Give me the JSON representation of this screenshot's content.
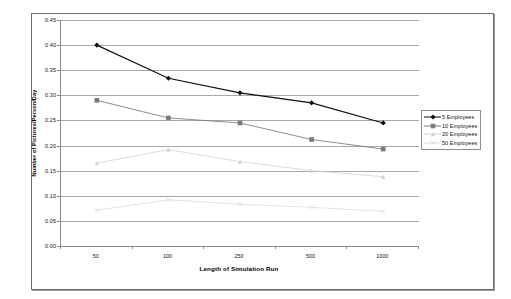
{
  "chart_data": {
    "type": "line",
    "title": "",
    "xlabel": "Length of Simulation Run",
    "ylabel": "Number of Pictures/Person/Day",
    "categories": [
      "50",
      "100",
      "250",
      "500",
      "1000"
    ],
    "ylim": [
      0.0,
      0.45
    ],
    "ytick_step": 0.05,
    "ytick_labels": [
      "0.00",
      "0.05",
      "0.10",
      "0.15",
      "0.20",
      "0.25",
      "0.30",
      "0.35",
      "0.40",
      "0.45"
    ],
    "ytick_values": [
      0.0,
      0.05,
      0.1,
      0.15,
      0.2,
      0.25,
      0.3,
      0.35,
      0.4,
      0.45
    ],
    "grid": "horizontal",
    "legend_position": "right",
    "series": [
      {
        "name": "5 Employees",
        "values": [
          0.4,
          0.334,
          0.305,
          0.285,
          0.245
        ],
        "color": "#101010",
        "marker": "diamond",
        "marker_size": 2.6,
        "line_width": 1.15
      },
      {
        "name": "10 Employees",
        "values": [
          0.29,
          0.255,
          0.245,
          0.212,
          0.193
        ],
        "color": "#7a7a7a",
        "marker": "square",
        "marker_size": 2.3,
        "line_width": 0.85
      },
      {
        "name": "20 Employees",
        "values": [
          0.165,
          0.192,
          0.168,
          0.15,
          0.138
        ],
        "color": "#d2d2d2",
        "marker": "triangle",
        "marker_size": 2.2,
        "line_width": 0.8
      },
      {
        "name": "50 Employees",
        "values": [
          0.071,
          0.092,
          0.083,
          0.077,
          0.069
        ],
        "color": "#dcdcdc",
        "marker": "cross",
        "marker_size": 2.2,
        "line_width": 0.8
      }
    ]
  },
  "legend": {
    "items": [
      {
        "label": "5 Employees"
      },
      {
        "label": "10 Employees"
      },
      {
        "label": "20 Employees"
      },
      {
        "label": "50 Employees"
      }
    ]
  },
  "axes": {
    "x_title": "Length of Simulation Run",
    "y_title": "Number of Pictures/Person/Day"
  },
  "colors": {
    "gridline": "#a8a8a8",
    "axis": "#8a8a8a",
    "frame": "#6b6b6b",
    "background": "#ffffff",
    "text": "#111111"
  }
}
